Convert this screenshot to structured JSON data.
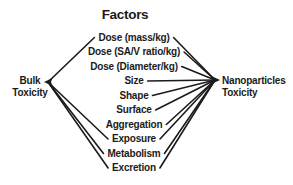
{
  "diagram": {
    "title": "Factors",
    "left_node": {
      "line1": "Bulk",
      "line2": "Toxicity"
    },
    "right_node": {
      "line1": "Nanoparticles",
      "line2": "Toxicity"
    },
    "factors": [
      {
        "label": "Dose (mass/kg)",
        "linked_to_bulk_toxicity": true,
        "linked_to_nanoparticles_toxicity": true
      },
      {
        "label": "Dose (SA/V ratio/kg)",
        "linked_to_bulk_toxicity": false,
        "linked_to_nanoparticles_toxicity": true
      },
      {
        "label": "Dose (Diameter/kg)",
        "linked_to_bulk_toxicity": false,
        "linked_to_nanoparticles_toxicity": true
      },
      {
        "label": "Size",
        "linked_to_bulk_toxicity": false,
        "linked_to_nanoparticles_toxicity": true
      },
      {
        "label": "Shape",
        "linked_to_bulk_toxicity": false,
        "linked_to_nanoparticles_toxicity": true
      },
      {
        "label": "Surface",
        "linked_to_bulk_toxicity": false,
        "linked_to_nanoparticles_toxicity": true
      },
      {
        "label": "Aggregation",
        "linked_to_bulk_toxicity": false,
        "linked_to_nanoparticles_toxicity": true
      },
      {
        "label": "Exposure",
        "linked_to_bulk_toxicity": true,
        "linked_to_nanoparticles_toxicity": true
      },
      {
        "label": "Metabolism",
        "linked_to_bulk_toxicity": true,
        "linked_to_nanoparticles_toxicity": true
      },
      {
        "label": "Excretion",
        "linked_to_bulk_toxicity": true,
        "linked_to_nanoparticles_toxicity": true
      }
    ],
    "colors": {
      "ink": "#1b1b1b",
      "background": "#ffffff"
    }
  }
}
